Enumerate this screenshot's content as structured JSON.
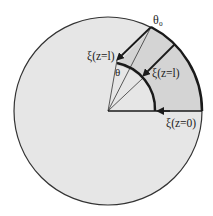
{
  "diagram": {
    "labels": {
      "theta0": "θ₀",
      "theta": "θ",
      "xi_left": "ξ(z=l)",
      "xi_mid": "ξ(z=l)",
      "xi_bottom": "ξ(z=0)"
    },
    "colors": {
      "circle_fill": "#e6e6e6",
      "sector_fill": "#d6d6d6",
      "stroke": "#1a1a1a"
    }
  }
}
